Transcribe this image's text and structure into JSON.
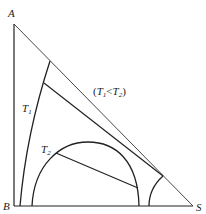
{
  "diagram": {
    "type": "ternary phase diagram (right-triangle form), liquid-liquid equilibrium",
    "vertices": [
      {
        "name": "A",
        "label": "A"
      },
      {
        "name": "B",
        "label": "B"
      },
      {
        "name": "S",
        "label": "S"
      }
    ],
    "curves": [
      {
        "name": "T1",
        "label_main": "T",
        "label_sub": "1"
      },
      {
        "name": "T2",
        "label_main": "T",
        "label_sub": "2"
      }
    ],
    "annotation": {
      "open": "(",
      "t1_main": "T",
      "t1_sub": "1",
      "op": "<",
      "t2_main": "T",
      "t2_sub": "2",
      "close": ")"
    },
    "colors": {
      "line": "#222222",
      "hypotenuse": "#333333",
      "background": "#ffffff"
    }
  }
}
